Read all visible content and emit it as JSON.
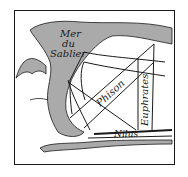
{
  "map": {
    "labels": {
      "sea_line1": "Mer",
      "sea_line2": "du",
      "sea_line3": "Sablier",
      "river_phison": "Phison",
      "river_euphrates": "Euphrates",
      "river_nilus": "Nilus"
    },
    "colors": {
      "ink": "#1a1a1a",
      "paper": "#ffffff",
      "hatch": "#555555"
    }
  }
}
